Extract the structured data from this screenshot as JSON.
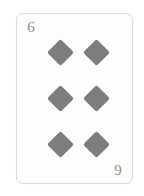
{
  "scene": {
    "background_color": "#ffffff",
    "subject": "playing-card"
  },
  "card": {
    "rank": "6",
    "suit_name": "diamonds",
    "suit_symbol": "♦",
    "label": "6 of Diamonds",
    "pip_count": 6,
    "colors": {
      "card_face": "#fdfdfd",
      "card_border": "#dcdcdc",
      "pip": "#7d7d7d",
      "index_text": "#8d8d8d"
    },
    "corners": [
      {
        "position": "top-left",
        "rank": "6",
        "suit_symbol": "♦",
        "rotated": false
      },
      {
        "position": "bottom-right",
        "rank": "6",
        "suit_symbol": "♦",
        "rotated": true
      }
    ],
    "pips": [
      {
        "row": 1,
        "column": 1,
        "suit_symbol": "♦"
      },
      {
        "row": 1,
        "column": 2,
        "suit_symbol": "♦"
      },
      {
        "row": 2,
        "column": 1,
        "suit_symbol": "♦"
      },
      {
        "row": 2,
        "column": 2,
        "suit_symbol": "♦"
      },
      {
        "row": 3,
        "column": 1,
        "suit_symbol": "♦"
      },
      {
        "row": 3,
        "column": 2,
        "suit_symbol": "♦"
      }
    ]
  }
}
